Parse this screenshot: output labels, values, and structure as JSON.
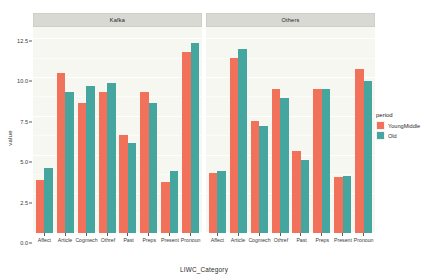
{
  "chart_data": {
    "type": "bar",
    "title": "",
    "xlabel": "LIWC_Category",
    "ylabel": "value",
    "ylim": [
      0,
      13.3
    ],
    "grid": true,
    "legend_position": "right",
    "legend_title": "period",
    "categories": [
      "Affect",
      "Article",
      "Cogmech",
      "Othref",
      "Past",
      "Preps",
      "Present",
      "Pronoun"
    ],
    "y_ticks": [
      "0.0",
      "2.5",
      "5.0",
      "7.5",
      "10.0",
      "12.5"
    ],
    "y_tick_values": [
      0.0,
      2.5,
      5.0,
      7.5,
      10.0,
      12.5
    ],
    "y_minor_values": [
      1.25,
      3.75,
      6.25,
      8.75,
      11.25
    ],
    "facets": [
      {
        "name": "Kafka",
        "series": [
          {
            "name": "YoungMiddle",
            "color": "#f1715a",
            "values": [
              3.4,
              10.3,
              8.4,
              9.1,
              6.3,
              9.1,
              3.3,
              11.7
            ]
          },
          {
            "name": "Old",
            "color": "#45a6a0",
            "values": [
              4.2,
              9.1,
              9.5,
              9.7,
              5.8,
              8.4,
              4.0,
              12.3
            ]
          }
        ]
      },
      {
        "name": "Others",
        "series": [
          {
            "name": "YoungMiddle",
            "color": "#f1715a",
            "values": [
              3.9,
              11.3,
              7.2,
              9.3,
              5.3,
              9.3,
              3.6,
              10.6
            ]
          },
          {
            "name": "Old",
            "color": "#45a6a0",
            "values": [
              4.0,
              11.9,
              6.9,
              8.7,
              4.7,
              9.3,
              3.7,
              9.8
            ]
          }
        ]
      }
    ],
    "legend_entries": [
      {
        "label": "YoungMiddle",
        "color": "#f1715a"
      },
      {
        "label": "Old",
        "color": "#45a6a0"
      }
    ]
  }
}
